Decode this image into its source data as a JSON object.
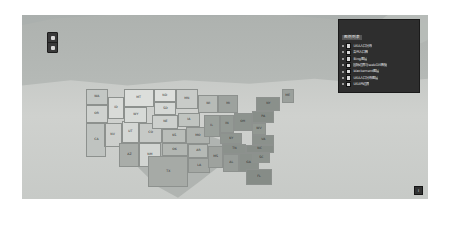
{
  "widget": {
    "zoom_control": {
      "zoom_in_label": "+",
      "zoom_out_label": "−"
    },
    "attribution_badge": "i"
  },
  "legend": {
    "title": "图例列表",
    "items": [
      {
        "label": "USA人口分布",
        "checked": true,
        "color": "#d8d8d8"
      },
      {
        "label": "各州人口数",
        "checked": true,
        "color": "#d8d8d8"
      },
      {
        "label": "Bing图层",
        "checked": true,
        "color": "#d8d8d8"
      },
      {
        "label": "国际边界与webGIS数据",
        "checked": true,
        "color": "#d8d8d8"
      },
      {
        "label": "blackement图层",
        "checked": true,
        "color": "#d8d8d8"
      },
      {
        "label": "USA人口分布图层",
        "checked": true,
        "color": "#d8d8d8"
      },
      {
        "label": "USA州边界",
        "checked": true,
        "color": "#d8d8d8"
      }
    ]
  },
  "map": {
    "states": [
      {
        "abbr": "WA",
        "x": 0,
        "y": 0,
        "w": 22,
        "h": 16,
        "color": "#c3c7c4"
      },
      {
        "abbr": "OR",
        "x": 0,
        "y": 16,
        "w": 22,
        "h": 18,
        "color": "#cfd2cf"
      },
      {
        "abbr": "CA",
        "x": 0,
        "y": 34,
        "w": 20,
        "h": 34,
        "color": "#bfc3c0"
      },
      {
        "abbr": "ID",
        "x": 22,
        "y": 8,
        "w": 16,
        "h": 22,
        "color": "#d9dbd8"
      },
      {
        "abbr": "NV",
        "x": 18,
        "y": 34,
        "w": 18,
        "h": 24,
        "color": "#cbcec b"
      },
      {
        "abbr": "UT",
        "x": 36,
        "y": 32,
        "w": 17,
        "h": 22,
        "color": "#d4d7d4"
      },
      {
        "abbr": "AZ",
        "x": 33,
        "y": 54,
        "w": 20,
        "h": 24,
        "color": "#a9ada9"
      },
      {
        "abbr": "MT",
        "x": 38,
        "y": 0,
        "w": 30,
        "h": 18,
        "color": "#dcdedb"
      },
      {
        "abbr": "WY",
        "x": 38,
        "y": 18,
        "w": 23,
        "h": 16,
        "color": "#d7dad7"
      },
      {
        "abbr": "CO",
        "x": 53,
        "y": 34,
        "w": 23,
        "h": 20,
        "color": "#c6c9c6"
      },
      {
        "abbr": "NM",
        "x": 53,
        "y": 54,
        "w": 22,
        "h": 24,
        "color": "#d2d5d2"
      },
      {
        "abbr": "ND",
        "x": 68,
        "y": 0,
        "w": 22,
        "h": 13,
        "color": "#dddfdc"
      },
      {
        "abbr": "SD",
        "x": 68,
        "y": 13,
        "w": 22,
        "h": 13,
        "color": "#d5d8d5"
      },
      {
        "abbr": "NE",
        "x": 66,
        "y": 26,
        "w": 26,
        "h": 14,
        "color": "#cdd0cd"
      },
      {
        "abbr": "KS",
        "x": 76,
        "y": 40,
        "w": 24,
        "h": 14,
        "color": "#b9bdb9"
      },
      {
        "abbr": "OK",
        "x": 76,
        "y": 54,
        "w": 26,
        "h": 13,
        "color": "#b2b6b2"
      },
      {
        "abbr": "TX",
        "x": 62,
        "y": 67,
        "w": 40,
        "h": 31,
        "color": "#a6aaa6"
      },
      {
        "abbr": "MN",
        "x": 90,
        "y": 0,
        "w": 22,
        "h": 20,
        "color": "#c8cbc8"
      },
      {
        "abbr": "IA",
        "x": 92,
        "y": 24,
        "w": 22,
        "h": 14,
        "color": "#c0c4c0"
      },
      {
        "abbr": "MO",
        "x": 100,
        "y": 38,
        "w": 24,
        "h": 17,
        "color": "#aeb2ae"
      },
      {
        "abbr": "AR",
        "x": 102,
        "y": 55,
        "w": 20,
        "h": 14,
        "color": "#b5b9b5"
      },
      {
        "abbr": "LA",
        "x": 102,
        "y": 69,
        "w": 22,
        "h": 15,
        "color": "#a3a7a3"
      },
      {
        "abbr": "WI",
        "x": 112,
        "y": 6,
        "w": 20,
        "h": 18,
        "color": "#b7bbb7"
      },
      {
        "abbr": "IL",
        "x": 118,
        "y": 26,
        "w": 16,
        "h": 22,
        "color": "#9aa09b"
      },
      {
        "abbr": "MS",
        "x": 122,
        "y": 57,
        "w": 15,
        "h": 22,
        "color": "#9ea29e"
      },
      {
        "abbr": "MI",
        "x": 132,
        "y": 6,
        "w": 20,
        "h": 18,
        "color": "#9da29e"
      },
      {
        "abbr": "IN",
        "x": 134,
        "y": 26,
        "w": 14,
        "h": 18,
        "color": "#949a95"
      },
      {
        "abbr": "KY",
        "x": 134,
        "y": 44,
        "w": 22,
        "h": 11,
        "color": "#8f9590"
      },
      {
        "abbr": "TN",
        "x": 136,
        "y": 55,
        "w": 24,
        "h": 10,
        "color": "#8b918c"
      },
      {
        "abbr": "AL",
        "x": 137,
        "y": 65,
        "w": 16,
        "h": 18,
        "color": "#979c98"
      },
      {
        "abbr": "OH",
        "x": 148,
        "y": 24,
        "w": 18,
        "h": 18,
        "color": "#8d938e"
      },
      {
        "abbr": "GA",
        "x": 153,
        "y": 64,
        "w": 20,
        "h": 19,
        "color": "#8a908b"
      },
      {
        "abbr": "FL",
        "x": 160,
        "y": 80,
        "w": 26,
        "h": 16,
        "color": "#868c87"
      },
      {
        "abbr": "WV",
        "x": 166,
        "y": 34,
        "w": 14,
        "h": 12,
        "color": "#929892"
      },
      {
        "abbr": "VA",
        "x": 166,
        "y": 46,
        "w": 22,
        "h": 10,
        "color": "#8b918c"
      },
      {
        "abbr": "NC",
        "x": 160,
        "y": 56,
        "w": 28,
        "h": 8,
        "color": "#878d88"
      },
      {
        "abbr": "SC",
        "x": 166,
        "y": 64,
        "w": 18,
        "h": 10,
        "color": "#8c928d"
      },
      {
        "abbr": "PA",
        "x": 166,
        "y": 22,
        "w": 22,
        "h": 12,
        "color": "#888e89"
      },
      {
        "abbr": "NY",
        "x": 170,
        "y": 8,
        "w": 24,
        "h": 14,
        "color": "#8a908b"
      },
      {
        "abbr": "ME",
        "x": 196,
        "y": 0,
        "w": 12,
        "h": 14,
        "color": "#9ba09c"
      }
    ]
  }
}
